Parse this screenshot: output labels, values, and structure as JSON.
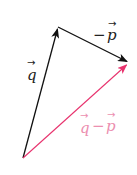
{
  "diagram": {
    "type": "vector-subtraction",
    "colors": {
      "black_vector": "#111111",
      "result_vector": "#e8336e",
      "result_label": "#ec8fb0",
      "background": "#ffffff"
    },
    "points": {
      "origin": [
        23,
        158
      ],
      "q_tip": [
        58,
        27
      ],
      "sum_tip": [
        128,
        62
      ]
    },
    "vectors": [
      {
        "id": "q",
        "label": "q",
        "from": "origin",
        "to": "q_tip",
        "color": "black"
      },
      {
        "id": "neg_p",
        "label": "−p",
        "from": "q_tip",
        "to": "sum_tip",
        "color": "black"
      },
      {
        "id": "q_minus_p",
        "label": "q−p",
        "from": "origin",
        "to": "sum_tip",
        "color": "pink"
      }
    ],
    "labels": {
      "q": {
        "text": "q",
        "arrow": "→",
        "x": 26,
        "y": 77
      },
      "neg_p": {
        "minus": "−",
        "text": "p",
        "arrow": "→",
        "x": 93,
        "y": 40
      },
      "q_minus_p": {
        "q": "q",
        "minus": "−",
        "p": "p",
        "arrow": "→",
        "x": 78,
        "y": 131
      }
    }
  }
}
